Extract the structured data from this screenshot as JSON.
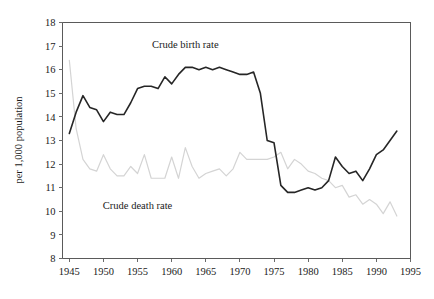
{
  "chart_data": {
    "type": "line",
    "title": "",
    "subtitle": "",
    "xlabel": "",
    "ylabel": "per 1,000 population",
    "xlim": [
      1944,
      1995
    ],
    "ylim": [
      8,
      18
    ],
    "grid": false,
    "legend_position": "inline-annotation",
    "x_ticks": [
      "1945",
      "1950",
      "1955",
      "1960",
      "1965",
      "1970",
      "1975",
      "1980",
      "1985",
      "1990",
      "1995"
    ],
    "y_ticks": [
      "8",
      "9",
      "10",
      "11",
      "12",
      "13",
      "14",
      "15",
      "16",
      "17",
      "18"
    ],
    "x": [
      1945,
      1946,
      1947,
      1948,
      1949,
      1950,
      1951,
      1952,
      1953,
      1954,
      1955,
      1956,
      1957,
      1958,
      1959,
      1960,
      1961,
      1962,
      1963,
      1964,
      1965,
      1966,
      1967,
      1968,
      1969,
      1970,
      1971,
      1972,
      1973,
      1974,
      1975,
      1976,
      1977,
      1978,
      1979,
      1980,
      1981,
      1982,
      1983,
      1984,
      1985,
      1986,
      1987,
      1988,
      1989,
      1990,
      1991,
      1992,
      1993
    ],
    "series": [
      {
        "name": "Crude birth rate",
        "color": "#262626",
        "label_x": 1962,
        "label_y": 16.9,
        "values": [
          13.3,
          14.2,
          14.9,
          14.4,
          14.3,
          13.8,
          14.2,
          14.1,
          14.1,
          14.6,
          15.2,
          15.3,
          15.3,
          15.2,
          15.7,
          15.4,
          15.8,
          16.1,
          16.1,
          16.0,
          16.1,
          16.0,
          16.1,
          16.0,
          15.9,
          15.8,
          15.8,
          15.9,
          15.0,
          13.0,
          12.9,
          11.1,
          10.8,
          10.8,
          10.9,
          11.0,
          10.9,
          11.0,
          11.3,
          12.3,
          11.9,
          11.6,
          11.7,
          11.3,
          11.8,
          12.4,
          12.6,
          13.0,
          13.4
        ]
      },
      {
        "name": "Crude death rate",
        "color": "#d4d4d4",
        "label_x": 1955,
        "label_y": 10.1,
        "values": [
          16.4,
          13.5,
          12.2,
          11.8,
          11.7,
          12.4,
          11.8,
          11.5,
          11.5,
          11.9,
          11.6,
          12.4,
          11.4,
          11.4,
          11.4,
          12.3,
          11.4,
          12.7,
          11.9,
          11.4,
          11.6,
          11.7,
          11.8,
          11.5,
          11.8,
          12.5,
          12.2,
          12.2,
          12.2,
          12.2,
          12.3,
          12.5,
          11.8,
          12.2,
          12.0,
          11.7,
          11.6,
          11.4,
          11.3,
          11.0,
          11.1,
          10.6,
          10.7,
          10.3,
          10.5,
          10.3,
          9.9,
          10.4,
          9.8
        ]
      }
    ]
  }
}
